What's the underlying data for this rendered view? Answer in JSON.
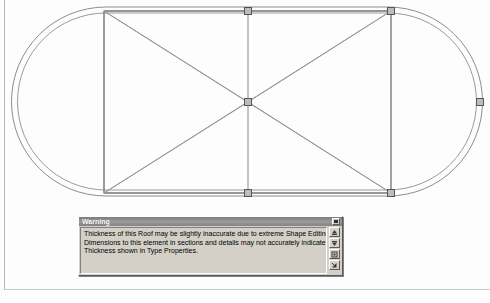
{
  "application": {
    "view_type": "roof-plan-shape-editing",
    "background_color": "#fdfdfd"
  },
  "drawing": {
    "name": "roof-stadium-plan",
    "description": "Stadium (obround) shaped roof in plan with double outline, inner rectangle, vertical ridge lines and X diagonals",
    "line_color": "#8a8a8a",
    "line_color_dark": "#6e6e6e",
    "grip_fill": "#b9b9b9",
    "grip_border": "#5f5f5f",
    "geometry": {
      "outer": {
        "left": 12,
        "top": 7,
        "right": 482,
        "bottom": 196,
        "radius": 94
      },
      "inner": {
        "left": 18,
        "top": 13,
        "right": 476,
        "bottom": 190,
        "radius": 88
      },
      "rect": {
        "left": 104,
        "top": 11,
        "right": 391,
        "bottom": 193
      },
      "verticals_x": [
        104,
        248,
        391
      ],
      "diagonals": "corner-to-corner X across the central rectangle",
      "grips": [
        {
          "name": "grip-top-center",
          "x": 248,
          "y": 11
        },
        {
          "name": "grip-top-right",
          "x": 391,
          "y": 11
        },
        {
          "name": "grip-center",
          "x": 248,
          "y": 102
        },
        {
          "name": "grip-bottom-center",
          "x": 248,
          "y": 193
        },
        {
          "name": "grip-bottom-right",
          "x": 391,
          "y": 193
        },
        {
          "name": "grip-right-edge",
          "x": 480,
          "y": 102
        }
      ]
    }
  },
  "warning_dialog": {
    "title": "Warning",
    "message_lines": [
      "Thickness of this Roof may be slightly inaccurate due to extreme Shape Editing.",
      "Dimensions to this element in sections and details may not accurately indicate the",
      "Thickness shown in Type Properties."
    ],
    "title_close_button": {
      "name": "close-button",
      "icon": "window-close-icon",
      "label": ""
    },
    "tool_buttons": [
      {
        "name": "previous-warning-button",
        "icon": "up-arrow-icon",
        "label": ""
      },
      {
        "name": "next-warning-button",
        "icon": "down-arrow-icon",
        "label": ""
      },
      {
        "name": "show-element-button",
        "icon": "show-box-icon",
        "label": ""
      },
      {
        "name": "expand-warning-button",
        "icon": "expand-arrow-icon",
        "label": ""
      }
    ]
  }
}
